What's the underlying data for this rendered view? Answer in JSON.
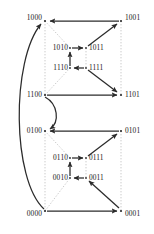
{
  "figure": {
    "width": 154,
    "height": 234,
    "background": "#ffffff",
    "solid_edge_color": "#2b2b2b",
    "dotted_edge_color": "#b4b4b4",
    "label_color": "#1a1a1a"
  },
  "chart_data": {
    "type": "diagram",
    "title": "",
    "nodes": [
      {
        "id": "1000",
        "label": "1000",
        "x": 45,
        "y": 21,
        "label_side": "right",
        "label_x": 42,
        "label_y": 18
      },
      {
        "id": "1001",
        "label": "1001",
        "x": 121,
        "y": 21,
        "label_side": "left",
        "label_x": 125,
        "label_y": 18
      },
      {
        "id": "1010",
        "label": "1010",
        "x": 70,
        "y": 48,
        "label_side": "right",
        "label_x": 68,
        "label_y": 48
      },
      {
        "id": "1011",
        "label": "1011",
        "x": 86,
        "y": 48,
        "label_side": "left",
        "label_x": 89,
        "label_y": 48
      },
      {
        "id": "1110",
        "label": "1110",
        "x": 70,
        "y": 68,
        "label_side": "right",
        "label_x": 68,
        "label_y": 68
      },
      {
        "id": "1111",
        "label": "1111",
        "x": 86,
        "y": 68,
        "label_side": "left",
        "label_x": 89,
        "label_y": 68
      },
      {
        "id": "1100",
        "label": "1100",
        "x": 45,
        "y": 95,
        "label_side": "right",
        "label_x": 42,
        "label_y": 95
      },
      {
        "id": "1101",
        "label": "1101",
        "x": 121,
        "y": 95,
        "label_side": "left",
        "label_x": 125,
        "label_y": 95
      },
      {
        "id": "0100",
        "label": "0100",
        "x": 45,
        "y": 131,
        "label_side": "right",
        "label_x": 42,
        "label_y": 131
      },
      {
        "id": "0101",
        "label": "0101",
        "x": 121,
        "y": 131,
        "label_side": "left",
        "label_x": 125,
        "label_y": 131
      },
      {
        "id": "0110",
        "label": "0110",
        "x": 70,
        "y": 158,
        "label_side": "right",
        "label_x": 68,
        "label_y": 158
      },
      {
        "id": "0111",
        "label": "0111",
        "x": 86,
        "y": 158,
        "label_side": "left",
        "label_x": 89,
        "label_y": 158
      },
      {
        "id": "0010",
        "label": "0010",
        "x": 70,
        "y": 178,
        "label_side": "right",
        "label_x": 68,
        "label_y": 178
      },
      {
        "id": "0011",
        "label": "0011",
        "x": 86,
        "y": 178,
        "label_side": "left",
        "label_x": 89,
        "label_y": 178
      },
      {
        "id": "0000",
        "label": "0000",
        "x": 45,
        "y": 211,
        "label_side": "right",
        "label_x": 42,
        "label_y": 214
      },
      {
        "id": "0001",
        "label": "0001",
        "x": 121,
        "y": 211,
        "label_side": "left",
        "label_x": 125,
        "label_y": 214
      }
    ],
    "solid_edges": [
      {
        "from": "1001",
        "to": "1000",
        "style": "straight"
      },
      {
        "from": "1011",
        "to": "1001",
        "style": "straight"
      },
      {
        "from": "1010",
        "to": "1011",
        "style": "straight"
      },
      {
        "from": "1111",
        "to": "1110",
        "style": "straight"
      },
      {
        "from": "1110",
        "to": "1010",
        "style": "straight"
      },
      {
        "from": "1111",
        "to": "1101",
        "style": "straight"
      },
      {
        "from": "1100",
        "to": "1101",
        "style": "straight"
      },
      {
        "from": "0101",
        "to": "0100",
        "style": "straight"
      },
      {
        "from": "0111",
        "to": "0101",
        "style": "straight"
      },
      {
        "from": "0110",
        "to": "0111",
        "style": "straight"
      },
      {
        "from": "0011",
        "to": "0010",
        "style": "straight"
      },
      {
        "from": "0010",
        "to": "0110",
        "style": "straight"
      },
      {
        "from": "0001",
        "to": "0011",
        "style": "straight"
      },
      {
        "from": "0000",
        "to": "0001",
        "style": "straight"
      },
      {
        "from": "1100",
        "to": "0100",
        "style": "s-curve"
      },
      {
        "from": "0000",
        "to": "1000",
        "style": "long-arc"
      }
    ],
    "dotted_edges": [
      {
        "from": "1000",
        "to": "1100"
      },
      {
        "from": "1000",
        "to": "1010"
      },
      {
        "from": "1100",
        "to": "1110"
      },
      {
        "from": "1001",
        "to": "1101"
      },
      {
        "from": "1011",
        "to": "1111"
      },
      {
        "from": "0100",
        "to": "0000"
      },
      {
        "from": "0100",
        "to": "0110"
      },
      {
        "from": "0000",
        "to": "0010"
      },
      {
        "from": "0101",
        "to": "0001"
      },
      {
        "from": "0111",
        "to": "0011"
      }
    ]
  }
}
